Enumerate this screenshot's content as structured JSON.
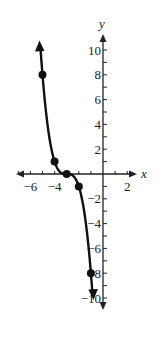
{
  "chart_data": {
    "type": "line",
    "title": "",
    "xlabel": "x",
    "ylabel": "y",
    "xlim": [
      -7,
      3
    ],
    "ylim": [
      -11,
      11
    ],
    "grid": false,
    "x_ticks": [
      -6,
      -4,
      2
    ],
    "x_minor_ticks": [
      -7,
      -6,
      -5,
      -4,
      -3,
      -2,
      -1,
      1,
      2
    ],
    "y_ticks": [
      10,
      8,
      6,
      4,
      2,
      -2,
      -4,
      -6,
      -8,
      -10
    ],
    "y_minor_ticks": [
      -10,
      -9,
      -8,
      -7,
      -6,
      -5,
      -4,
      -3,
      -2,
      -1,
      1,
      2,
      3,
      4,
      5,
      6,
      7,
      8,
      9,
      10
    ],
    "x_tick_labels": [
      "−6",
      "−4",
      "2"
    ],
    "y_tick_labels": [
      "10",
      "8",
      "6",
      "4",
      "2",
      "−2",
      "−4",
      "−6",
      "−8",
      "−10"
    ],
    "series": [
      {
        "name": "curve",
        "points": [
          [
            -5,
            8
          ],
          [
            -4,
            1
          ],
          [
            -3,
            0
          ],
          [
            -2,
            -1
          ],
          [
            -1,
            -8
          ]
        ],
        "arrows": [
          "up",
          "down"
        ],
        "color": "#111111"
      }
    ]
  }
}
